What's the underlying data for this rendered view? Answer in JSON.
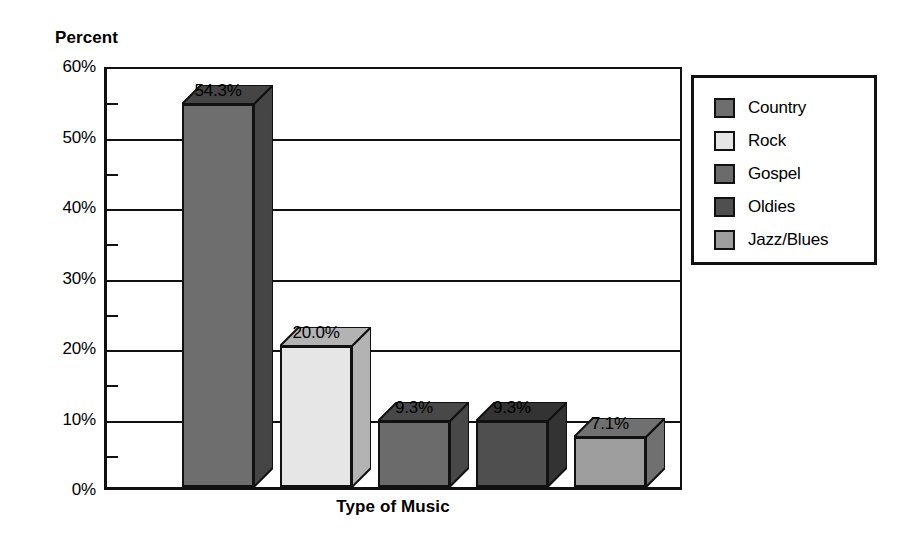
{
  "chart_data": {
    "type": "bar",
    "title": "",
    "subtitle": "",
    "xlabel": "Type of Music",
    "ylabel": "Percent",
    "categories": [
      "Country",
      "Rock",
      "Gospel",
      "Oldies",
      "Jazz/Blues"
    ],
    "values": [
      54.3,
      20.0,
      9.3,
      9.3,
      7.1
    ],
    "data_labels": [
      "54.3%",
      "20.0%",
      "9.3%",
      "9.3%",
      "7.1%"
    ],
    "ylim": [
      0,
      60
    ],
    "y_major_ticks": [
      0,
      10,
      20,
      30,
      40,
      50,
      60
    ],
    "y_tick_labels": [
      "0%",
      "10%",
      "20%",
      "30%",
      "40%",
      "50%",
      "60%"
    ],
    "y_minor_ticks": [
      5,
      15,
      25,
      35,
      45,
      55
    ],
    "grid": true,
    "grid_axis": "y",
    "legend_position": "right",
    "legend_entries": [
      "Country",
      "Rock",
      "Gospel",
      "Oldies",
      "Jazz/Blues"
    ],
    "style": "3d-bars-grayscale",
    "series_colors": [
      "#6e6e6e",
      "#e6e6e6",
      "#6b6b6b",
      "#4f4f4f",
      "#9e9e9e"
    ],
    "series_side_colors": [
      "#454545",
      "#b3b3b3",
      "#484848",
      "#333333",
      "#707070"
    ]
  },
  "axes": {
    "y_title": "Percent",
    "x_title": "Type of Music",
    "y_labels": [
      "60%",
      "50%",
      "40%",
      "30%",
      "20%",
      "10%",
      "0%"
    ]
  },
  "legend": {
    "items": [
      {
        "label": "Country",
        "color": "#6e6e6e"
      },
      {
        "label": "Rock",
        "color": "#e6e6e6"
      },
      {
        "label": "Gospel",
        "color": "#6b6b6b"
      },
      {
        "label": "Oldies",
        "color": "#4f4f4f"
      },
      {
        "label": "Jazz/Blues",
        "color": "#9e9e9e"
      }
    ]
  },
  "bars": [
    {
      "label": "Country",
      "value_label": "54.3%"
    },
    {
      "label": "Rock",
      "value_label": "20.0%"
    },
    {
      "label": "Gospel",
      "value_label": "9.3%"
    },
    {
      "label": "Oldies",
      "value_label": "9.3%"
    },
    {
      "label": "Jazz/Blues",
      "value_label": "7.1%"
    }
  ]
}
